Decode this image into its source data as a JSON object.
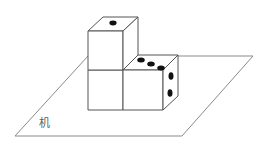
{
  "figure": {
    "surface_label": "机",
    "surface_label_meaning": "table surface",
    "colors": {
      "background": "#ffffff",
      "plane_stroke": "#8a8a8a",
      "cube_stroke": "#555555",
      "pip_fill": "#111111",
      "cube_face_fill": "#ffffff",
      "label_text": "#5d5d5d"
    },
    "plane": {
      "name": "table-plane",
      "shape": "parallelogram",
      "points": "15,136 88,56 253,56 182,136"
    },
    "cubes": [
      {
        "id": "top-cube",
        "position": "upper-left, stacked on left lower cube",
        "top_face_pips": 1,
        "faces": {
          "top": "88,31 103,17 138,17 123,31",
          "front": "88,31 123,31 123,70 88,70",
          "right": "123,31 138,17 138,55 123,70"
        },
        "pips": {
          "top": [
            {
              "cx": 113,
              "cy": 23,
              "rx": 3.6,
              "ry": 2.4
            }
          ]
        }
      },
      {
        "id": "left-lower-cube",
        "position": "lower-left, beneath top cube",
        "visible_pips": 0,
        "faces": {
          "front": "88,70 123,70 123,110 88,110"
        }
      },
      {
        "id": "right-cube",
        "position": "lower-right",
        "top_face_pips": 3,
        "right_face_pips": 2,
        "faces": {
          "top": "123,70 138,55 178,55 163,70",
          "front": "123,70 163,70 163,110 123,110",
          "right": "163,70 178,55 178,96 163,110"
        },
        "pips": {
          "top": [
            {
              "cx": 141,
              "cy": 60,
              "rx": 3.8,
              "ry": 2.5
            },
            {
              "cx": 151,
              "cy": 64,
              "rx": 3.8,
              "ry": 2.5
            },
            {
              "cx": 161,
              "cy": 68,
              "rx": 3.8,
              "ry": 2.5
            }
          ],
          "right": [
            {
              "cx": 171,
              "cy": 76,
              "rx": 2.5,
              "ry": 3.8
            },
            {
              "cx": 170,
              "cy": 93,
              "rx": 2.5,
              "ry": 3.8
            }
          ]
        }
      }
    ],
    "label_position": {
      "x": 39,
      "y": 127
    }
  }
}
